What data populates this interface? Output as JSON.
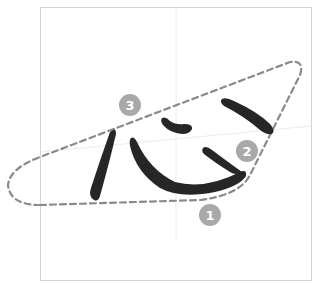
{
  "diagram": {
    "character": "心",
    "colors": {
      "frame": "#d4d4d4",
      "guide": "#ececec",
      "ink": "#262626",
      "outline": "#8a8a8a",
      "marker_fill": "#a9a9a9",
      "marker_text": "#ffffff"
    },
    "markers": [
      {
        "label": "1"
      },
      {
        "label": "2"
      },
      {
        "label": "3"
      }
    ]
  }
}
